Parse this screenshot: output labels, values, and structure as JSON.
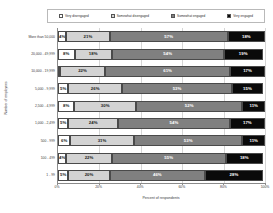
{
  "chart_data": {
    "type": "bar",
    "subtype": "stacked-horizontal-100pct",
    "title": "",
    "xlabel": "Percent of respondents",
    "ylabel": "Number of employees",
    "xlim": [
      0,
      100
    ],
    "xticks": [
      "0%",
      "20%",
      "40%",
      "60%",
      "80%",
      "100%"
    ],
    "xtick_values": [
      0,
      20,
      40,
      60,
      80,
      100
    ],
    "grid": true,
    "legend_position": "top",
    "categories": [
      "More than 50,000",
      "20,000 - 49,999",
      "10,000 - 19,999",
      "5,000 - 9,999",
      "2,500 - 4,999",
      "1,000 - 2,499",
      "500 - 999",
      "100 - 499",
      "1 - 99"
    ],
    "series": [
      {
        "name": "Very disengaged",
        "color": "#ffffff",
        "values": [
          4,
          8,
          0,
          5,
          8,
          5,
          6,
          4,
          5
        ]
      },
      {
        "name": "Somewhat disengaged",
        "color": "#d3d3d3",
        "values": [
          21,
          18,
          22,
          26,
          30,
          24,
          31,
          22,
          20
        ]
      },
      {
        "name": "Somewhat engaged",
        "color": "#808080",
        "values": [
          57,
          54,
          61,
          53,
          52,
          54,
          53,
          55,
          46
        ]
      },
      {
        "name": "Very engaged",
        "color": "#0a0a0a",
        "values": [
          18,
          19,
          17,
          15,
          11,
          17,
          11,
          18,
          28
        ]
      }
    ],
    "value_labels": [
      [
        "4%",
        "21%",
        "57%",
        "18%"
      ],
      [
        "8%",
        "18%",
        "54%",
        "19%"
      ],
      [
        "0%",
        "22%",
        "61%",
        "17%"
      ],
      [
        "5%",
        "26%",
        "53%",
        "15%"
      ],
      [
        "8%",
        "30%",
        "52%",
        "11%"
      ],
      [
        "5%",
        "24%",
        "54%",
        "17%"
      ],
      [
        "6%",
        "31%",
        "53%",
        "11%"
      ],
      [
        "4%",
        "22%",
        "55%",
        "18%"
      ],
      [
        "5%",
        "20%",
        "46%",
        "28%"
      ]
    ]
  }
}
